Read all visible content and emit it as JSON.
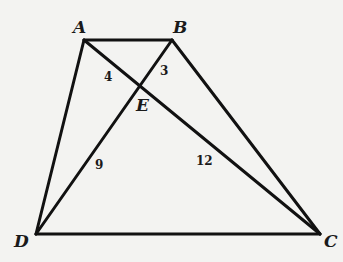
{
  "diagram": {
    "type": "trapezoid-with-diagonals",
    "background": "#f3f3f1",
    "stroke_color": "#111111",
    "vertices": {
      "A": {
        "label": "A",
        "x": 84,
        "y": 40
      },
      "B": {
        "label": "B",
        "x": 172,
        "y": 40
      },
      "C": {
        "label": "C",
        "x": 320,
        "y": 234
      },
      "D": {
        "label": "D",
        "x": 36,
        "y": 234
      },
      "E": {
        "label": "E",
        "x": 142,
        "y": 86
      }
    },
    "edges": [
      {
        "from": "A",
        "to": "B"
      },
      {
        "from": "B",
        "to": "C"
      },
      {
        "from": "C",
        "to": "D"
      },
      {
        "from": "D",
        "to": "A"
      },
      {
        "from": "A",
        "to": "C"
      },
      {
        "from": "B",
        "to": "D"
      }
    ],
    "segment_labels": [
      {
        "segment": "AE",
        "text": "4"
      },
      {
        "segment": "BE",
        "text": "3"
      },
      {
        "segment": "DE",
        "text": "9"
      },
      {
        "segment": "CE",
        "text": "12"
      }
    ]
  }
}
